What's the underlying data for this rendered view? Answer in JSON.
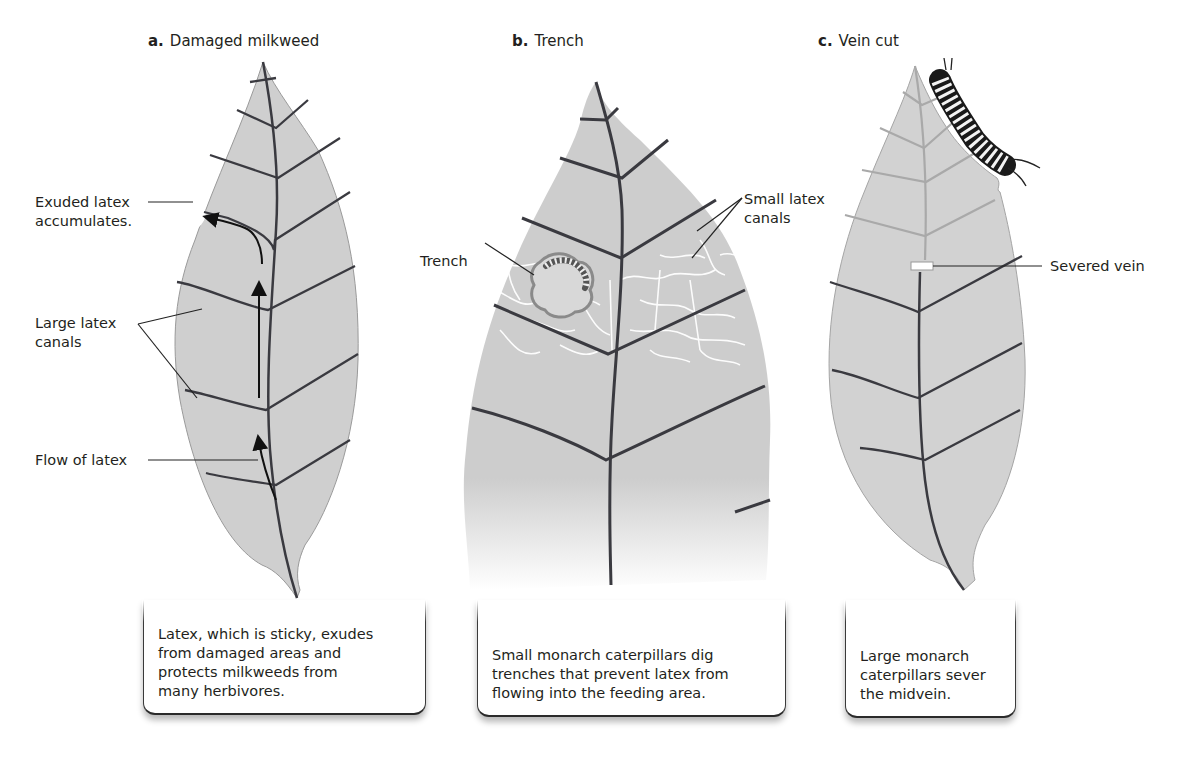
{
  "header_fragment": "",
  "panels": [
    {
      "letter": "a.",
      "title": "Damaged milkweed",
      "labels": {
        "exuded": "Exuded latex\naccumulates.",
        "large_canals": "Large latex\ncanals",
        "flow": "Flow of latex"
      },
      "caption": "Latex, which is sticky, exudes\nfrom damaged areas and\nprotects milkweeds from\nmany herbivores."
    },
    {
      "letter": "b.",
      "title": "Trench",
      "labels": {
        "trench": "Trench",
        "small_canals": "Small latex\ncanals"
      },
      "caption": "Small monarch caterpillars dig\ntrenches that prevent latex from\nflowing into the feeding area."
    },
    {
      "letter": "c.",
      "title": "Vein cut",
      "labels": {
        "severed": "Severed vein"
      },
      "caption": "Large monarch\ncaterpillars sever\nthe midvein."
    }
  ],
  "colors": {
    "leaf_fill": "#cfcfcf",
    "vein": "#3a3a40",
    "faded_vein": "#a9a9a9",
    "latex_canal": "#ffffff",
    "background": "#ffffff"
  }
}
